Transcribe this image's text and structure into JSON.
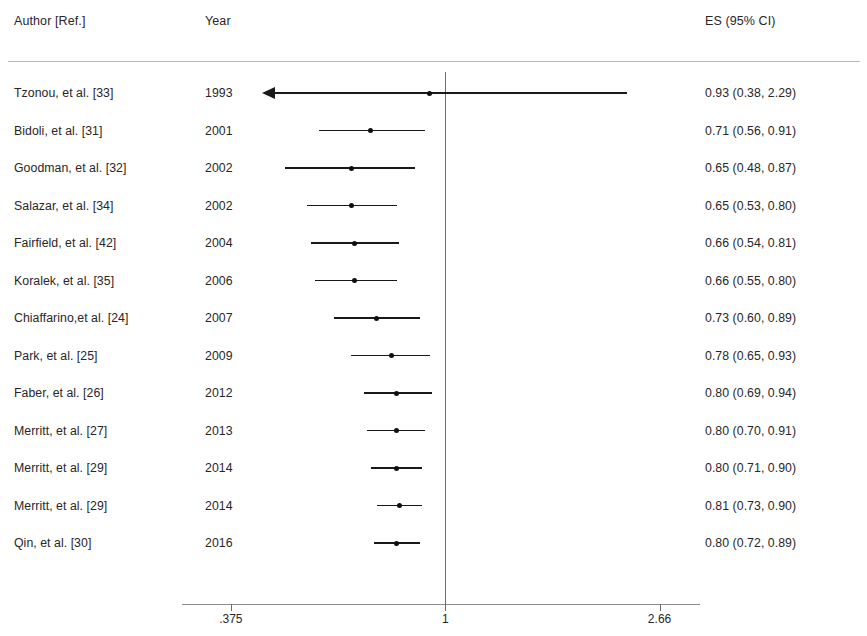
{
  "header": {
    "author_label": "Author [Ref.]",
    "year_label": "Year",
    "es_label": "ES (95% CI)"
  },
  "axis": {
    "ticks": [
      {
        "label": ".375",
        "value": 0.375
      },
      {
        "label": "1",
        "value": 1
      },
      {
        "label": "2.66",
        "value": 2.66
      }
    ],
    "reference_value": 1
  },
  "chart_data": {
    "type": "forest",
    "title": "",
    "xlabel": "",
    "ylabel": "",
    "scale": "log",
    "xlim": [
      0.375,
      2.66
    ],
    "reference_line": 1,
    "grid": false,
    "legend": "none",
    "columns": [
      "Author [Ref.]",
      "Year",
      "ES (95% CI)"
    ],
    "effect_measure": "ES",
    "ci_level": "95%",
    "studies": [
      {
        "author": "Tzonou, et al. [33]",
        "year": "1993",
        "es": 0.93,
        "lcl": 0.38,
        "ucl": 2.29,
        "es_text": "0.93 (0.38, 2.29)",
        "clipped_left": true
      },
      {
        "author": "Bidoli, et al. [31]",
        "year": "2001",
        "es": 0.71,
        "lcl": 0.56,
        "ucl": 0.91,
        "es_text": "0.71 (0.56, 0.91)",
        "clipped_left": false
      },
      {
        "author": "Goodman, et al. [32]",
        "year": "2002",
        "es": 0.65,
        "lcl": 0.48,
        "ucl": 0.87,
        "es_text": "0.65 (0.48, 0.87)",
        "clipped_left": false
      },
      {
        "author": "Salazar, et al. [34]",
        "year": "2002",
        "es": 0.65,
        "lcl": 0.53,
        "ucl": 0.8,
        "es_text": "0.65 (0.53, 0.80)",
        "clipped_left": false
      },
      {
        "author": "Fairfield, et al. [42]",
        "year": "2004",
        "es": 0.66,
        "lcl": 0.54,
        "ucl": 0.81,
        "es_text": "0.66 (0.54, 0.81)",
        "clipped_left": false
      },
      {
        "author": "Koralek, et al. [35]",
        "year": "2006",
        "es": 0.66,
        "lcl": 0.55,
        "ucl": 0.8,
        "es_text": "0.66 (0.55, 0.80)",
        "clipped_left": false
      },
      {
        "author": "Chiaffarino,et al. [24]",
        "year": "2007",
        "es": 0.73,
        "lcl": 0.6,
        "ucl": 0.89,
        "es_text": "0.73 (0.60, 0.89)",
        "clipped_left": false
      },
      {
        "author": "Park, et al. [25]",
        "year": "2009",
        "es": 0.78,
        "lcl": 0.65,
        "ucl": 0.93,
        "es_text": "0.78 (0.65, 0.93)",
        "clipped_left": false
      },
      {
        "author": "Faber, et al. [26]",
        "year": "2012",
        "es": 0.8,
        "lcl": 0.69,
        "ucl": 0.94,
        "es_text": "0.80 (0.69, 0.94)",
        "clipped_left": false
      },
      {
        "author": "Merritt, et al. [27]",
        "year": "2013",
        "es": 0.8,
        "lcl": 0.7,
        "ucl": 0.91,
        "es_text": "0.80 (0.70, 0.91)",
        "clipped_left": false
      },
      {
        "author": "Merritt, et al. [29]",
        "year": "2014",
        "es": 0.8,
        "lcl": 0.71,
        "ucl": 0.9,
        "es_text": "0.80 (0.71, 0.90)",
        "clipped_left": false
      },
      {
        "author": "Merritt, et al. [29]",
        "year": "2014",
        "es": 0.81,
        "lcl": 0.73,
        "ucl": 0.9,
        "es_text": "0.81 (0.73, 0.90)",
        "clipped_left": false
      },
      {
        "author": "Qin, et al. [30]",
        "year": "2016",
        "es": 0.8,
        "lcl": 0.72,
        "ucl": 0.89,
        "es_text": "0.80 (0.72, 0.89)",
        "clipped_left": false
      }
    ]
  },
  "geometry": {
    "first_row_y": 93,
    "row_step": 37.5,
    "axis_x_left_px": 182,
    "axis_x_right_px": 700,
    "axis_left_value": 0.3,
    "axis_right_value": 3.2
  },
  "colors": {
    "ink": "#1b1819",
    "rule": "#b9b8b8",
    "axis": "#8d8b8c"
  }
}
